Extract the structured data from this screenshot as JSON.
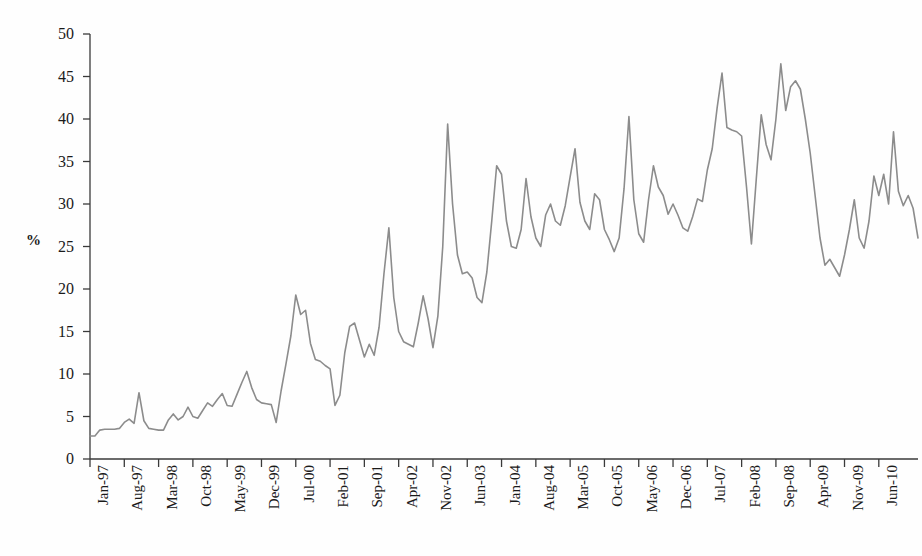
{
  "chart_data": {
    "type": "line",
    "title": "",
    "subtitle": "",
    "xlabel": "",
    "ylabel": "%",
    "ylim": [
      0,
      50
    ],
    "ytick_step": 5,
    "yticks": [
      0,
      5,
      10,
      15,
      20,
      25,
      30,
      35,
      40,
      45,
      50
    ],
    "grid": false,
    "legend": false,
    "legend_position": "none",
    "line_color": "#8c8c8c",
    "axis_color": "#3a3a3a",
    "background_color": "#fefefe",
    "x_tick_labels": [
      "Jan-97",
      "Aug-97",
      "Mar-98",
      "Oct-98",
      "May-99",
      "Dec-99",
      "Jul-00",
      "Feb-01",
      "Sep-01",
      "Apr-02",
      "Nov-02",
      "Jun-03",
      "Jan-04",
      "Aug-04",
      "Mar-05",
      "Oct-05",
      "May-06",
      "Dec-06",
      "Jul-07",
      "Feb-08",
      "Sep-08",
      "Apr-09",
      "Nov-09",
      "Jun-10"
    ],
    "x_tick_interval_months": 7,
    "x_start": "Jan-97",
    "x_end": "Sep-10",
    "series": [
      {
        "name": "percentage",
        "values": [
          2.7,
          2.7,
          3.4,
          3.5,
          3.5,
          3.5,
          3.6,
          4.3,
          4.7,
          4.2,
          7.8,
          4.5,
          3.6,
          3.5,
          3.4,
          3.4,
          4.6,
          5.3,
          4.6,
          5.0,
          6.1,
          5.0,
          4.8,
          5.7,
          6.6,
          6.2,
          7.0,
          7.7,
          6.3,
          6.2,
          7.6,
          9.0,
          10.3,
          8.4,
          7.0,
          6.6,
          6.5,
          6.4,
          4.3,
          8.0,
          11.2,
          14.5,
          19.3,
          17.0,
          17.5,
          13.6,
          11.7,
          11.5,
          11.0,
          10.6,
          6.3,
          7.5,
          12.5,
          15.6,
          16.0,
          14.0,
          12.0,
          13.5,
          12.2,
          15.5,
          21.8,
          27.2,
          19.0,
          15.0,
          13.8,
          13.5,
          13.2,
          16.0,
          19.2,
          16.5,
          13.1,
          16.8,
          25.0,
          39.4,
          30.0,
          24.0,
          21.8,
          22.0,
          21.3,
          19.0,
          18.4,
          22.0,
          28.0,
          34.5,
          33.5,
          28.0,
          25.0,
          24.8,
          27.0,
          33.0,
          28.5,
          26.0,
          25.0,
          28.7,
          30.0,
          28.0,
          27.5,
          29.8,
          33.2,
          36.5,
          30.2,
          28.0,
          27.0,
          31.2,
          30.5,
          27.0,
          25.8,
          24.4,
          26.0,
          31.8,
          40.3,
          30.5,
          26.5,
          25.5,
          30.5,
          34.5,
          32.0,
          31.0,
          28.8,
          30.0,
          28.7,
          27.2,
          26.8,
          28.5,
          30.6,
          30.3,
          34.0,
          36.5,
          41.3,
          45.4,
          39.0,
          38.7,
          38.5,
          38.0,
          32.0,
          25.3,
          33.0,
          40.5,
          37.0,
          35.2,
          40.0,
          46.5,
          41.0,
          43.8,
          44.5,
          43.5,
          40.0,
          36.0,
          31.0,
          26.0,
          22.8,
          23.5,
          22.5,
          21.5,
          24.0,
          27.0,
          30.5,
          26.0,
          24.8,
          28.0,
          33.3,
          31.0,
          33.5,
          30.0,
          38.5,
          31.5,
          29.8,
          31.0,
          29.5,
          26.0
        ]
      }
    ]
  }
}
